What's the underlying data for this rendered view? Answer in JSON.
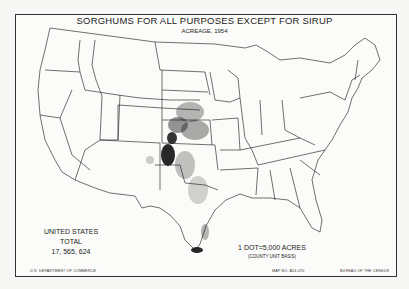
{
  "map": {
    "title": "SORGHUMS FOR ALL PURPOSES EXCEPT FOR SIRUP",
    "subtitle": "ACREAGE, 1954",
    "total_label": "UNITED STATES TOTAL",
    "total_value": "17, 565, 624",
    "scale_label": "1 DOT=5,000 ACRES",
    "scale_basis": "(COUNTY UNIT BASIS)",
    "footer_left": "U.S. DEPARTMENT OF COMMERCE",
    "footer_center": "MAP NO. A54-070",
    "footer_right": "BUREAU OF THE CENSUS",
    "colors": {
      "ink": "#222222",
      "paper": "#fbfbf9",
      "dots": "#111111"
    },
    "concentration_regions": [
      "Texas Panhandle",
      "Western Kansas",
      "Oklahoma",
      "South Texas coast",
      "Nebraska",
      "Colorado east",
      "New Mexico east"
    ]
  }
}
